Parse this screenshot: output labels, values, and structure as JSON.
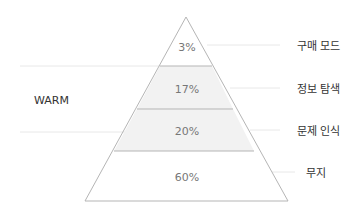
{
  "diagram": {
    "type": "pyramid",
    "group_label": "WARM",
    "levels": [
      {
        "percent": "3%",
        "label": "구매 모드",
        "shaded": false
      },
      {
        "percent": "17%",
        "label": "정보 탐색",
        "shaded": true
      },
      {
        "percent": "20%",
        "label": "문제 인식",
        "shaded": true
      },
      {
        "percent": "60%",
        "label": "무지",
        "shaded": false
      }
    ],
    "colors": {
      "outline": "#b8b8b8",
      "shade": "#f1f1f1",
      "guide": "#e6e6e6",
      "percent_text": "#777777",
      "label_text": "#333333"
    }
  }
}
